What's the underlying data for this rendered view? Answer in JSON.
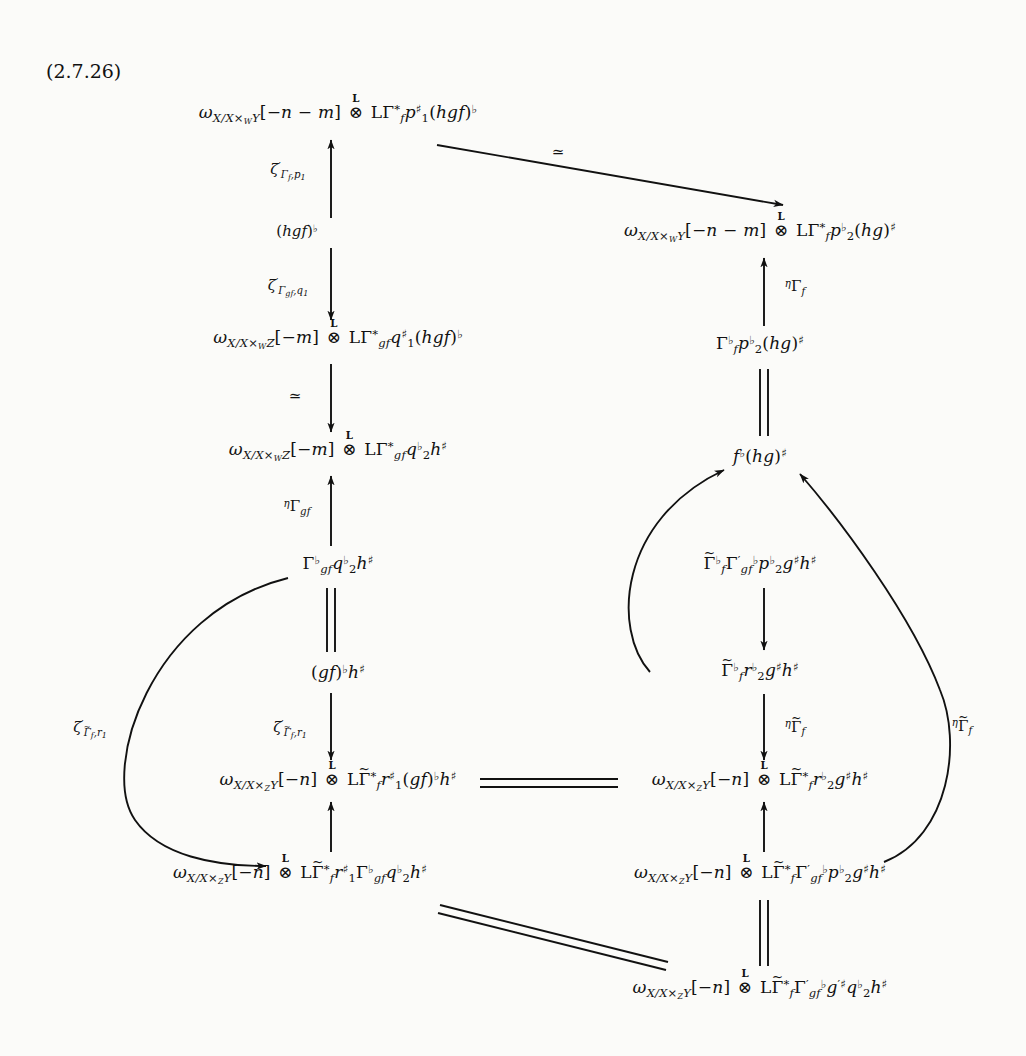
{
  "document": {
    "equation_tag": "(2.7.26)",
    "type": "commutative-diagram",
    "background_color": "#fbfbf9",
    "ink_color": "#111111"
  },
  "nodes": {
    "n1": {
      "id": "top-left",
      "html": "<i class='v'>&omega;</i><sub><i class='v'>X</i>/<i class='v'>X</i>&times;<sub><i class='v'>W</i></sub><i class='v'>Y</i></sub>[&minus;<i class='v'>n</i> &minus; <i class='v'>m</i>] <span class='otimes-wrap'><span class='bold-L'>L</span>&otimes;</span> <span class='up'>L</span>&Gamma;<span class='supup'>*</span><sub><i class='v'>f</i></sub><i class='v'>p</i><span class='supup'>&#9839;</span><span class='subup'>1</span>(<i class='v'>hgf</i>)<sup class='up'>&#9837;</sup>",
      "x": 338,
      "y": 115
    },
    "n2": {
      "id": "right-upper",
      "html": "<i class='v'>&omega;</i><sub><i class='v'>X</i>/<i class='v'>X</i>&times;<sub><i class='v'>W</i></sub><i class='v'>Y</i></sub>[&minus;<i class='v'>n</i> &minus; <i class='v'>m</i>] <span class='otimes-wrap'><span class='bold-L'>L</span>&otimes;</span> <span class='up'>L</span>&Gamma;<span class='supup'>*</span><sub><i class='v'>f</i></sub><i class='v'>p</i><span class='supup'>&#9837;</span><span class='subup'>2</span>(<i class='v'>hg</i>)<sup class='up'>&#9839;</sup>",
      "x": 760,
      "y": 233
    },
    "n3": {
      "id": "left-second",
      "html": "<i class='v'>&omega;</i><sub><i class='v'>X</i>/<i class='v'>X</i>&times;<sub><i class='v'>W</i></sub><i class='v'>Z</i></sub>[&minus;<i class='v'>m</i>] <span class='otimes-wrap'><span class='bold-L'>L</span>&otimes;</span> <span class='up'>L</span>&Gamma;<span class='supup'>*</span><sub><i class='v'>gf</i></sub><i class='v'>q</i><span class='supup'>&#9839;</span><span class='subup'>1</span>(<i class='v'>hgf</i>)<sup class='up'>&#9837;</sup>",
      "x": 338,
      "y": 340
    },
    "n4": {
      "id": "left-third",
      "html": "<i class='v'>&omega;</i><sub><i class='v'>X</i>/<i class='v'>X</i>&times;<sub><i class='v'>W</i></sub><i class='v'>Z</i></sub>[&minus;<i class='v'>m</i>] <span class='otimes-wrap'><span class='bold-L'>L</span>&otimes;</span> <span class='up'>L</span>&Gamma;<span class='supup'>*</span><sub><i class='v'>gf</i></sub><i class='v'>q</i><span class='supup'>&#9837;</span><span class='subup'>2</span><i class='v'>h</i><sup class='up'>&#9839;</sup>",
      "x": 338,
      "y": 452
    },
    "n5": {
      "id": "left-gamma-gf",
      "html": "&Gamma;<sup class='up'>&#9837;</sup><sub><i class='v'>gf</i></sub><i class='v'>q</i><span class='supup'>&#9837;</span><span class='subup'>2</span><i class='v'>h</i><sup class='up'>&#9839;</sup>",
      "x": 338,
      "y": 565
    },
    "n6": {
      "id": "left-gf-flat",
      "html": "(<i class='v'>gf</i>)<sup class='up'>&#9837;</sup><i class='v'>h</i><sup class='up'>&#9839;</sup>",
      "x": 338,
      "y": 672
    },
    "n7": {
      "id": "center-bottom-left",
      "html": "<i class='v'>&omega;</i><sub><i class='v'>X</i>/<i class='v'>X</i>&times;<sub><i class='v'>Z</i></sub><i class='v'>Y</i></sub>[&minus;<i class='v'>n</i>] <span class='otimes-wrap'><span class='bold-L'>L</span>&otimes;</span> <span class='up'>L</span><span class='tilde-over'><span class='tl'>~</span>&Gamma;</span><span class='supup'>*</span><sub><i class='v'>f</i></sub><i class='v'>r</i><span class='supup'>&#9839;</span><span class='subup'>1</span>(<i class='v'>gf</i>)<sup class='up'>&#9837;</sup><i class='v'>h</i><sup class='up'>&#9839;</sup>",
      "x": 338,
      "y": 782
    },
    "n8": {
      "id": "center-bottom-right",
      "html": "<i class='v'>&omega;</i><sub><i class='v'>X</i>/<i class='v'>X</i>&times;<sub><i class='v'>Z</i></sub><i class='v'>Y</i></sub>[&minus;<i class='v'>n</i>] <span class='otimes-wrap'><span class='bold-L'>L</span>&otimes;</span> <span class='up'>L</span><span class='tilde-over'><span class='tl'>~</span>&Gamma;</span><span class='supup'>*</span><sub><i class='v'>f</i></sub><i class='v'>r</i><span class='supup'>&#9837;</span><span class='subup'>2</span><i class='v'>g</i><sup class='up'>&#9839;</sup><i class='v'>h</i><sup class='up'>&#9839;</sup>",
      "x": 760,
      "y": 782
    },
    "n9": {
      "id": "bottom-left",
      "html": "<i class='v'>&omega;</i><sub><i class='v'>X</i>/<i class='v'>X</i>&times;<sub><i class='v'>Z</i></sub><i class='v'>Y</i></sub>[&minus;<i class='v'>n</i>] <span class='otimes-wrap'><span class='bold-L'>L</span>&otimes;</span> <span class='up'>L</span><span class='tilde-over'><span class='tl'>~</span>&Gamma;</span><span class='supup'>*</span><sub><i class='v'>f</i></sub><i class='v'>r</i><span class='supup'>&#9839;</span><span class='subup'>1</span>&Gamma;<span class='supup'>&#9837;</span><sub><i class='v'>gf</i></sub><i class='v'>q</i><span class='supup'>&#9837;</span><span class='subup'>2</span><i class='v'>h</i><sup class='up'>&#9839;</sup>",
      "x": 300,
      "y": 875
    },
    "n10": {
      "id": "bottom-right",
      "html": "<i class='v'>&omega;</i><sub><i class='v'>X</i>/<i class='v'>X</i>&times;<sub><i class='v'>Z</i></sub><i class='v'>Y</i></sub>[&minus;<i class='v'>n</i>] <span class='otimes-wrap'><span class='bold-L'>L</span>&otimes;</span> <span class='up'>L</span><span class='tilde-over'><span class='tl'>~</span>&Gamma;</span><span class='supup'>*</span><sub><i class='v'>f</i></sub>&Gamma;<span class='supup'>&prime;</span><sub><i class='v'>gf</i></sub><sup class='up'>&#9837;</sup><i class='v'>p</i><span class='supup'>&#9837;</span><span class='subup'>2</span><i class='v'>g</i><sup class='up'>&#9839;</sup><i class='v'>h</i><sup class='up'>&#9839;</sup>",
      "x": 760,
      "y": 875
    },
    "n11": {
      "id": "bottom-center-last",
      "html": "<i class='v'>&omega;</i><sub><i class='v'>X</i>/<i class='v'>X</i>&times;<sub><i class='v'>Z</i></sub><i class='v'>Y</i></sub>[&minus;<i class='v'>n</i>] <span class='otimes-wrap'><span class='bold-L'>L</span>&otimes;</span> <span class='up'>L</span><span class='tilde-over'><span class='tl'>~</span>&Gamma;</span><span class='supup'>*</span><sub><i class='v'>f</i></sub>&Gamma;<span class='supup'>&prime;</span><sub><i class='v'>gf</i></sub><sup class='up'>&#9837;</sup><i class='v'>g</i><span class='supup'>&prime;&#9839;</span><i class='v'>q</i><span class='supup'>&#9837;</span><span class='subup'>2</span><i class='v'>h</i><sup class='up'>&#9839;</sup>",
      "x": 760,
      "y": 990
    },
    "n12": {
      "id": "right-gamma-f",
      "html": "&Gamma;<sup class='up'>&#9837;</sup><sub><i class='v'>f</i></sub><i class='v'>p</i><span class='supup'>&#9837;</span><span class='subup'>2</span>(<i class='v'>hg</i>)<sup class='up'>&#9839;</sup>",
      "x": 760,
      "y": 345
    },
    "n13": {
      "id": "right-f-flat",
      "html": "<i class='v'>f</i><sup class='up'>&#9837;</sup>(<i class='v'>hg</i>)<sup class='up'>&#9839;</sup>",
      "x": 760,
      "y": 456
    },
    "n14": {
      "id": "right-gammatilde-big",
      "html": "<span class='tilde-over'><span class='tl'>~</span>&Gamma;</span><sup class='up'>&#9837;</sup><sub><i class='v'>f</i></sub>&Gamma;<span class='supup'>&prime;</span><sub><i class='v'>gf</i></sub><sup class='up'>&#9837;</sup><i class='v'>p</i><span class='supup'>&#9837;</span><span class='subup'>2</span><i class='v'>g</i><sup class='up'>&#9839;</sup><i class='v'>h</i><sup class='up'>&#9839;</sup>",
      "x": 760,
      "y": 565
    },
    "n15": {
      "id": "right-gammatilde-r2",
      "html": "<span class='tilde-over'><span class='tl'>~</span>&Gamma;</span><sup class='up'>&#9837;</sup><sub><i class='v'>f</i></sub><i class='v'>r</i><span class='supup'>&#9837;</span><span class='subup'>2</span><i class='v'>g</i><sup class='up'>&#9839;</sup><i class='v'>h</i><sup class='up'>&#9839;</sup>",
      "x": 760,
      "y": 672
    }
  },
  "labels": {
    "l1": {
      "id": "zeta-gamma-f-p1",
      "html": "<i class='v'>&zeta;</i><span class='supup'>&prime;</span><sub>&Gamma;<sub class='tiny'><i class='v'>f</i></sub>,<i class='v'>p</i><sub class='tiny'>1</sub></sub>",
      "x": 288,
      "y": 172
    },
    "l2": {
      "id": "hgf-flat",
      "html": "(<i class='v'>hgf</i>)<sup class='up'>&#9837;</sup>",
      "x": 297,
      "y": 232
    },
    "l3": {
      "id": "zeta-gamma-gf-q1",
      "html": "<i class='v'>&zeta;</i><span class='supup'>&prime;</span><sub>&Gamma;<sub class='tiny'><i class='v'>gf</i></sub>,<i class='v'>q</i><sub class='tiny'>1</sub></sub>",
      "x": 288,
      "y": 288
    },
    "l4": {
      "id": "iso-left",
      "html": "&#8771;",
      "x": 295,
      "y": 397
    },
    "l5": {
      "id": "eta-gamma-gf",
      "html": "<sup class='up'><i class='v'>&eta;</i></sup>&Gamma;<sub><i class='v'>gf</i></sub>",
      "x": 297,
      "y": 508
    },
    "l6": {
      "id": "iso-diagonal-top",
      "html": "&#8771;",
      "x": 558,
      "y": 153
    },
    "l7": {
      "id": "eta-gamma-f",
      "html": "<sup class='up'><i class='v'>&eta;</i></sup>&Gamma;<sub><i class='v'>f</i></sub>",
      "x": 795,
      "y": 288
    },
    "l8": {
      "id": "eta-gammatilde-f-mid",
      "html": "<sup class='up'><i class='v'>&eta;</i></sup><span class='tilde-over'><span class='tl'>~</span>&Gamma;</span><sub><i class='v'>f</i></sub>",
      "x": 795,
      "y": 728
    },
    "l9": {
      "id": "zeta-gammatilde-f-r1-outer",
      "html": "<i class='v'>&zeta;</i><span class='supup'>&prime;</span><sub><span class='tilde-over'><span class='tl'>~</span>&Gamma;</span><sub class='tiny'><i class='v'>f</i></sub>,<i class='v'>r</i><sub class='tiny'>1</sub></sub>",
      "x": 90,
      "y": 730
    },
    "l10": {
      "id": "zeta-gammatilde-f-r1-inner",
      "html": "<i class='v'>&zeta;</i><span class='supup'>&prime;</span><sub><span class='tilde-over'><span class='tl'>~</span>&Gamma;</span><sub class='tiny'><i class='v'>f</i></sub>,<i class='v'>r</i><sub class='tiny'>1</sub></sub>",
      "x": 290,
      "y": 730
    },
    "l11": {
      "id": "eta-gammatilde-f-right",
      "html": "<sup class='up'><i class='v'>&eta;</i></sup><span class='tilde-over'><span class='tl'>~</span>&Gamma;</span><sub><i class='v'>f</i></sub>",
      "x": 962,
      "y": 727
    }
  },
  "arrows": [
    {
      "name": "arrow-n3-to-n1-up",
      "kind": "single-up"
    },
    {
      "name": "arrow-n1-to-n2-diagonal-iso",
      "kind": "single-diagonal"
    },
    {
      "name": "arrow-n1-to-n3-down",
      "kind": "single-down"
    },
    {
      "name": "arrow-n3-to-n4-down-iso",
      "kind": "single-down"
    },
    {
      "name": "arrow-n4-to-n5-up",
      "kind": "single-up"
    },
    {
      "name": "equality-n5-n6",
      "kind": "double-vertical"
    },
    {
      "name": "arrow-n6-to-n7-down",
      "kind": "single-down"
    },
    {
      "name": "arrow-n12-to-n2-up",
      "kind": "single-up"
    },
    {
      "name": "equality-n12-n13",
      "kind": "double-vertical"
    },
    {
      "name": "curve-n14-to-n13",
      "kind": "curved"
    },
    {
      "name": "arrow-n14-to-n15-down",
      "kind": "single-down"
    },
    {
      "name": "arrow-n15-to-n8-down",
      "kind": "single-down"
    },
    {
      "name": "equality-n7-n8-horizontal",
      "kind": "double-horizontal"
    },
    {
      "name": "arrow-n9-to-n7-up",
      "kind": "single-up"
    },
    {
      "name": "arrow-n10-to-n8-up",
      "kind": "single-up"
    },
    {
      "name": "curve-n5-to-n9-outer-left",
      "kind": "curved"
    },
    {
      "name": "curve-n10-to-n13-outer-right",
      "kind": "curved"
    },
    {
      "name": "equality-n9-n11-diagonal",
      "kind": "double-diagonal"
    },
    {
      "name": "equality-n10-n11-vertical",
      "kind": "double-vertical"
    }
  ]
}
